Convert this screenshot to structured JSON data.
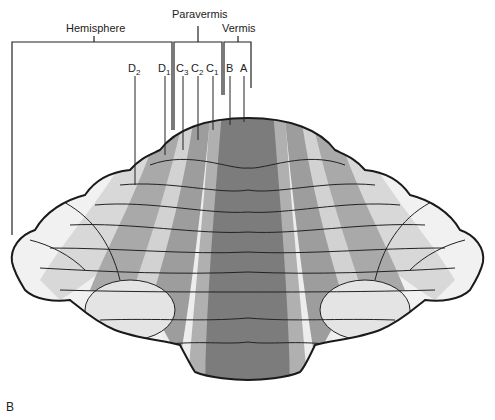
{
  "figure": {
    "panel_letter": "B",
    "region_labels": {
      "hemisphere": "Hemisphere",
      "paravermis": "Paravermis",
      "vermis": "Vermis"
    },
    "zone_labels": [
      {
        "base": "D",
        "sub": "2"
      },
      {
        "base": "D",
        "sub": "1"
      },
      {
        "base": "C",
        "sub": "3"
      },
      {
        "base": "C",
        "sub": "2"
      },
      {
        "base": "C",
        "sub": "1"
      },
      {
        "base": "B",
        "sub": ""
      },
      {
        "base": "A",
        "sub": ""
      }
    ],
    "colors": {
      "vermis_A": "#7a7a7a",
      "zone_B": "#a8a8a8",
      "zone_C1": "#9a9a9a",
      "zone_C2": "#cfcfcf",
      "zone_C3": "#a3a3a3",
      "zone_D1": "#c8c8c8",
      "zone_D2": "#e6e6e6",
      "outline": "#1a1a1a",
      "background": "#ffffff"
    }
  }
}
